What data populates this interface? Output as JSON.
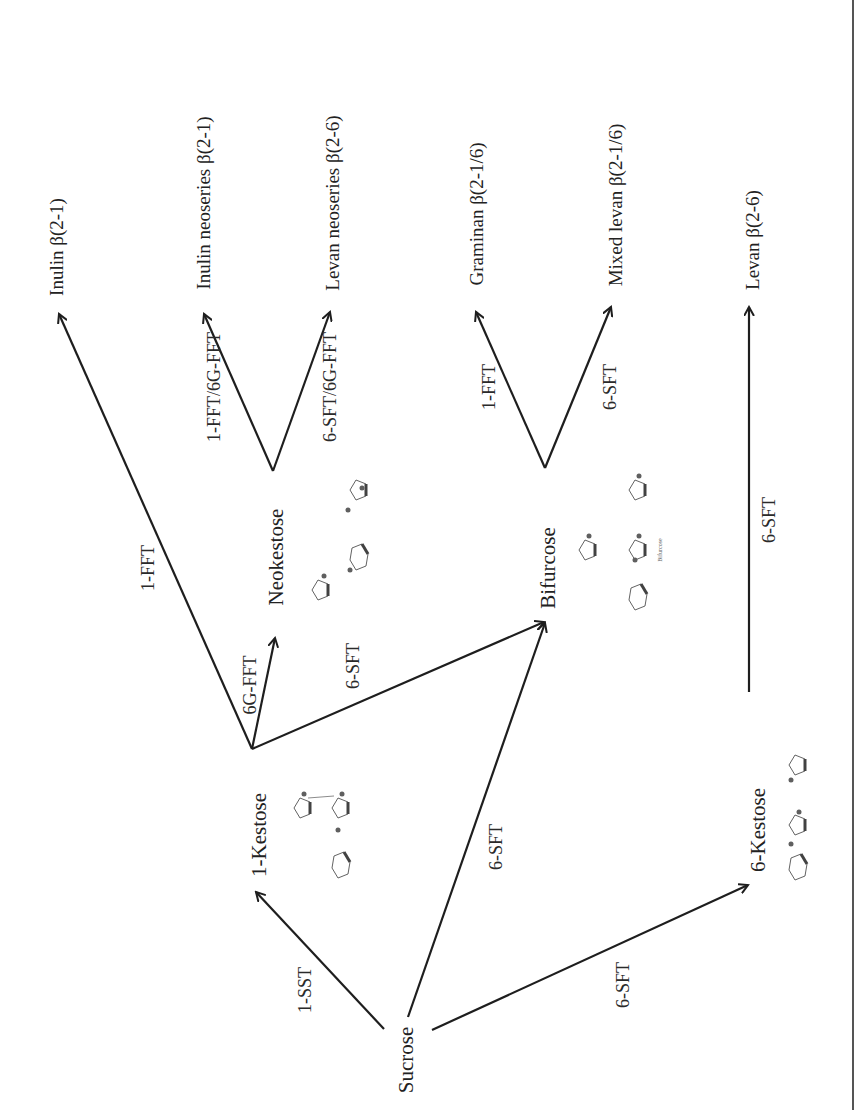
{
  "diagram": {
    "nodes": {
      "sucrose": "Sucrose",
      "kestose1": "1-Kestose",
      "kestose6": "6-Kestose",
      "neokestose": "Neokestose",
      "bifurcose": "Bifurcose"
    },
    "products": {
      "inulin": "Inulin β(2-1)",
      "inulin_neo": "Inulin neoseries β(2-1)",
      "levan_neo": "Levan neoseries β(2-6)",
      "graminan": "Graminan β(2-1/6)",
      "mixed_levan": "Mixed levan β(2-1/6)",
      "levan": "Levan β(2-6)"
    },
    "enzymes": {
      "sucrose_to_1kestose": "1-SST",
      "sucrose_to_bifurcose": "6-SFT",
      "sucrose_to_6kestose": "6-SFT",
      "kestose1_to_inulin": "1-FFT",
      "kestose1_to_neokestose": "6G-FFT",
      "kestose1_to_bifurcose": "6-SFT",
      "neokestose_to_inulin_neo": "1-FFT/6G-FFT",
      "neokestose_to_levan_neo": "6-SFT/6G-FFT",
      "bifurcose_to_graminan": "1-FFT",
      "bifurcose_to_mixed_levan": "6-SFT",
      "kestose6_to_levan": "6-SFT"
    },
    "structure_caption": "Bifurcose",
    "line_color": "#1e1e1e"
  }
}
